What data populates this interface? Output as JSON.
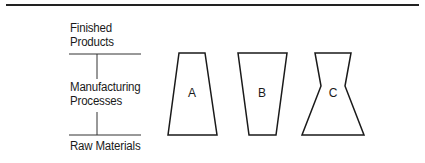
{
  "diagram": {
    "axis_labels": {
      "top": [
        "Finished",
        "Products"
      ],
      "middle": [
        "Manufacturing",
        "Processes"
      ],
      "bottom": "Raw Materials"
    },
    "shapes": [
      {
        "label": "A",
        "form": "trapezoid-narrow-top"
      },
      {
        "label": "B",
        "form": "trapezoid-narrow-bottom"
      },
      {
        "label": "C",
        "form": "hourglass-wide-bottom"
      }
    ]
  }
}
